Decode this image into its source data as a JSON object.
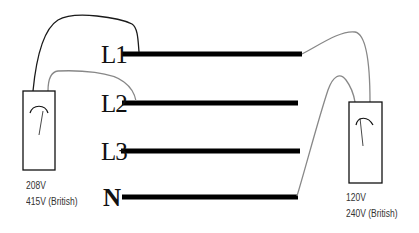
{
  "diagram": {
    "buses": [
      {
        "id": "L1",
        "label": "L1",
        "y": 54,
        "x1": 122,
        "x2": 302
      },
      {
        "id": "L2",
        "label": "L2",
        "y": 103,
        "x1": 122,
        "x2": 298
      },
      {
        "id": "L3",
        "label": "L3",
        "y": 151,
        "x1": 121,
        "x2": 300
      },
      {
        "id": "N",
        "label": "N",
        "y": 197,
        "x1": 122,
        "x2": 298
      }
    ],
    "meters": [
      {
        "id": "left-meter",
        "connected_to": [
          "L1",
          "L2"
        ],
        "voltage_lines": [
          "208V",
          "415V (British)"
        ]
      },
      {
        "id": "right-meter",
        "connected_to": [
          "L1",
          "N"
        ],
        "voltage_lines": [
          "120V",
          "240V (British)"
        ]
      }
    ],
    "colors": {
      "bus": "#000000",
      "wire_black": "#1a1a1a",
      "wire_grey": "#888888",
      "meter_border": "#111111"
    }
  }
}
